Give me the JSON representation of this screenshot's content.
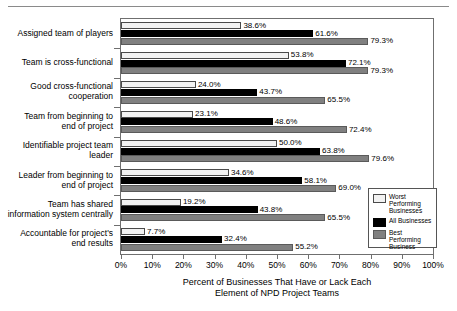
{
  "chart_data": {
    "type": "bar",
    "orientation": "horizontal",
    "title": "",
    "xlabel": "Percent of Businesses That Have or Lack Each Element of NPD Project Teams",
    "ylabel": "",
    "xlim": [
      0,
      100
    ],
    "xticks": [
      "0%",
      "10%",
      "20%",
      "30%",
      "40%",
      "50%",
      "60%",
      "70%",
      "80%",
      "90%",
      "100%"
    ],
    "xtick_values": [
      0,
      10,
      20,
      30,
      40,
      50,
      60,
      70,
      80,
      90,
      100
    ],
    "grid": false,
    "legend_position": "inside-bottom-right",
    "categories": [
      "Assigned team of players",
      "Team is cross-functional",
      "Good cross-functional cooperation",
      "Team from beginning to end of project",
      "Identifiable project team leader",
      "Leader from beginning to end of project",
      "Team has shared information system centrally",
      "Accountable for project's end results"
    ],
    "series": [
      {
        "name": "Worst Performing Businesses",
        "color": "#f2f2f2",
        "values": [
          38.6,
          53.8,
          24.0,
          23.1,
          50.0,
          34.6,
          19.2,
          7.7
        ],
        "labels": [
          "38.6%",
          "53.8%",
          "24.0%",
          "23.1%",
          "50.0%",
          "34.6%",
          "19.2%",
          "7.7%"
        ]
      },
      {
        "name": "All Businesses",
        "color": "#000000",
        "values": [
          61.6,
          72.1,
          43.7,
          48.6,
          63.8,
          58.1,
          43.8,
          32.4
        ],
        "labels": [
          "61.6%",
          "72.1%",
          "43.7%",
          "48.6%",
          "63.8%",
          "58.1%",
          "43.8%",
          "32.4%"
        ]
      },
      {
        "name": "Best Performing Business",
        "color": "#808080",
        "values": [
          79.3,
          79.3,
          65.5,
          72.4,
          79.6,
          69.0,
          65.5,
          55.2
        ],
        "labels": [
          "79.3%",
          "79.3%",
          "65.5%",
          "72.4%",
          "79.6%",
          "69.0%",
          "65.5%",
          "55.2%"
        ]
      }
    ]
  },
  "y_axis_captions": [
    "Assigned team of players",
    "Team is cross-functional",
    "Good cross-functional\ncooperation",
    "Team from beginning to\nend of project",
    "Identifiable project team\nleader",
    "Leader from beginning to\nend of project",
    "Team has shared\ninformation system centrally",
    "Accountable for project's\nend results"
  ],
  "legend": {
    "entries": [
      {
        "label": "Worst\nPerforming\nBusinesses",
        "swatch": "worst"
      },
      {
        "label": "All Businesses",
        "swatch": "all"
      },
      {
        "label": "Best\nPerforming\nBusiness",
        "swatch": "best"
      }
    ]
  }
}
